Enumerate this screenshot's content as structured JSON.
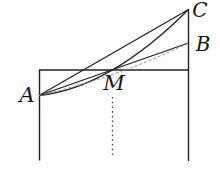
{
  "figure": {
    "type": "geometry-diagram",
    "labels": {
      "A": "A",
      "B": "B",
      "C": "C",
      "M": "M"
    },
    "colors": {
      "background": "#fdfdfd",
      "ink": "#222222",
      "faint": "#8f8f8f",
      "dotted": "#4a4a4a"
    }
  }
}
